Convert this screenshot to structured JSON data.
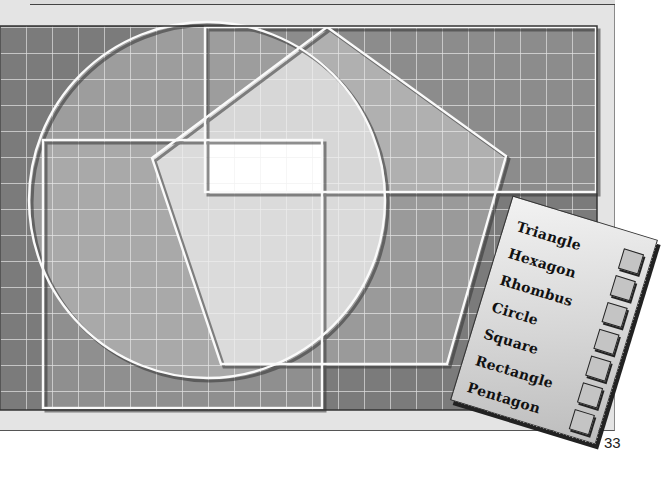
{
  "page": {
    "number": "33"
  },
  "illustration": {
    "colors": {
      "grid_bg": "#7b7b7b",
      "grid_line": "#f4f4f4",
      "mid_fill": "#a8a8a8",
      "light_fill": "#d9d9d9",
      "white_fill": "#ffffff"
    },
    "shapes": [
      "circle",
      "square",
      "rectangle",
      "pentagon",
      "white-rectangle"
    ]
  },
  "shape_card": {
    "items": [
      {
        "label": "Triangle"
      },
      {
        "label": "Hexagon"
      },
      {
        "label": "Rhombus"
      },
      {
        "label": "Circle"
      },
      {
        "label": "Square"
      },
      {
        "label": "Rectangle"
      },
      {
        "label": "Pentagon"
      }
    ]
  }
}
